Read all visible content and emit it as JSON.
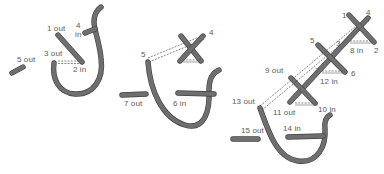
{
  "diagram": {
    "type": "embroidery-stitch-steps",
    "figures": [
      {
        "id": "figure-1",
        "labels": [
          {
            "key": "1",
            "text": "1 out",
            "x": 47,
            "y": 25
          },
          {
            "key": "4",
            "text": "4",
            "x": 76,
            "y": 22
          },
          {
            "key": "4in",
            "text": "in",
            "x": 76,
            "y": 31
          },
          {
            "key": "3",
            "text": "3 out",
            "x": 44,
            "y": 50
          },
          {
            "key": "2",
            "text": "2 in",
            "x": 73,
            "y": 66
          },
          {
            "key": "5",
            "text": "5 out",
            "x": 17,
            "y": 56
          }
        ]
      },
      {
        "id": "figure-2",
        "labels": [
          {
            "key": "4",
            "text": "4",
            "x": 209,
            "y": 29
          },
          {
            "key": "5",
            "text": "5",
            "x": 141,
            "y": 51
          },
          {
            "key": "7",
            "text": "7 out",
            "x": 124,
            "y": 100
          },
          {
            "key": "6",
            "text": "6 in",
            "x": 173,
            "y": 100
          }
        ]
      },
      {
        "id": "figure-3",
        "labels": [
          {
            "key": "1",
            "text": "1",
            "x": 342,
            "y": 12
          },
          {
            "key": "4",
            "text": "4",
            "x": 366,
            "y": 9
          },
          {
            "key": "5",
            "text": "5",
            "x": 310,
            "y": 37
          },
          {
            "key": "3",
            "text": "3",
            "x": 336,
            "y": 40
          },
          {
            "key": "8",
            "text": "8 in",
            "x": 350,
            "y": 47
          },
          {
            "key": "2",
            "text": "2",
            "x": 374,
            "y": 47
          },
          {
            "key": "9",
            "text": "9 out",
            "x": 265,
            "y": 67
          },
          {
            "key": "7",
            "text": "7",
            "x": 315,
            "y": 67
          },
          {
            "key": "6",
            "text": "6",
            "x": 351,
            "y": 70
          },
          {
            "key": "12",
            "text": "12 in",
            "x": 320,
            "y": 78
          },
          {
            "key": "13",
            "text": "13 out",
            "x": 232,
            "y": 98
          },
          {
            "key": "11",
            "text": "11 out",
            "x": 273,
            "y": 109
          },
          {
            "key": "10",
            "text": "10 in",
            "x": 318,
            "y": 106
          },
          {
            "key": "15",
            "text": "15 out",
            "x": 241,
            "y": 127
          },
          {
            "key": "14",
            "text": "14 in",
            "x": 283,
            "y": 125
          }
        ]
      }
    ],
    "colors": {
      "thread": "#6f6f6f",
      "thread_edge": "#3f3f3f",
      "label": "#5a5a5a",
      "background": "#ffffff"
    }
  }
}
